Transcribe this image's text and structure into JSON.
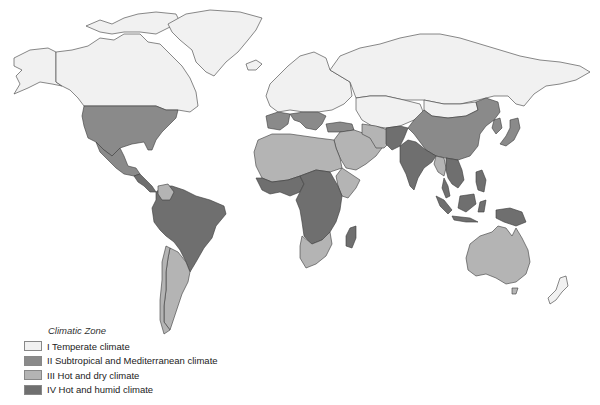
{
  "map": {
    "title": "World climatic zones",
    "zones": {
      "I": {
        "name": "Temperate climate",
        "color": "#f1f1f1"
      },
      "II": {
        "name": "Subtropical and Mediterranean climate",
        "color": "#8a8a8a"
      },
      "III": {
        "name": "Hot and dry climate",
        "color": "#b4b4b4"
      },
      "IV": {
        "name": "Hot and humid climate",
        "color": "#6f6f6f"
      }
    },
    "regions": [
      {
        "name": "Canada",
        "zone": "I"
      },
      {
        "name": "Alaska",
        "zone": "I"
      },
      {
        "name": "Greenland",
        "zone": "I"
      },
      {
        "name": "Iceland",
        "zone": "I"
      },
      {
        "name": "Northern Europe",
        "zone": "I"
      },
      {
        "name": "Russia",
        "zone": "I"
      },
      {
        "name": "Central Asia",
        "zone": "I"
      },
      {
        "name": "Mongolia",
        "zone": "I"
      },
      {
        "name": "New Zealand",
        "zone": "I"
      },
      {
        "name": "United States",
        "zone": "II"
      },
      {
        "name": "Mexico",
        "zone": "II"
      },
      {
        "name": "Iberia",
        "zone": "II"
      },
      {
        "name": "Mediterranean Europe",
        "zone": "II"
      },
      {
        "name": "Turkey",
        "zone": "II"
      },
      {
        "name": "China",
        "zone": "II"
      },
      {
        "name": "Japan",
        "zone": "II"
      },
      {
        "name": "Pakistan",
        "zone": "IV"
      },
      {
        "name": "India",
        "zone": "IV"
      },
      {
        "name": "Southeast Asia",
        "zone": "IV"
      },
      {
        "name": "Indonesia",
        "zone": "IV"
      },
      {
        "name": "Papua New Guinea",
        "zone": "IV"
      },
      {
        "name": "Central America",
        "zone": "IV"
      },
      {
        "name": "Northern South America",
        "zone": "IV"
      },
      {
        "name": "Brazil",
        "zone": "IV"
      },
      {
        "name": "West Africa",
        "zone": "IV"
      },
      {
        "name": "Central Africa",
        "zone": "IV"
      },
      {
        "name": "East Africa",
        "zone": "IV"
      },
      {
        "name": "Madagascar",
        "zone": "IV"
      },
      {
        "name": "North Africa",
        "zone": "III"
      },
      {
        "name": "Middle East",
        "zone": "III"
      },
      {
        "name": "Iran",
        "zone": "III"
      },
      {
        "name": "Horn of Africa",
        "zone": "III"
      },
      {
        "name": "Southern Africa",
        "zone": "III"
      },
      {
        "name": "Argentina",
        "zone": "III"
      },
      {
        "name": "Venezuela",
        "zone": "III"
      },
      {
        "name": "Australia",
        "zone": "III"
      },
      {
        "name": "Myanmar",
        "zone": "III"
      }
    ]
  },
  "legend": {
    "title": "Climatic Zone",
    "items": [
      {
        "label": "I Temperate climate",
        "zone": "I",
        "color": "#f1f1f1"
      },
      {
        "label": "II Subtropical and Mediterranean climate",
        "zone": "II",
        "color": "#8a8a8a"
      },
      {
        "label": "III Hot and dry climate",
        "zone": "III",
        "color": "#b4b4b4"
      },
      {
        "label": "IV Hot and humid climate",
        "zone": "IV",
        "color": "#6f6f6f"
      }
    ]
  }
}
